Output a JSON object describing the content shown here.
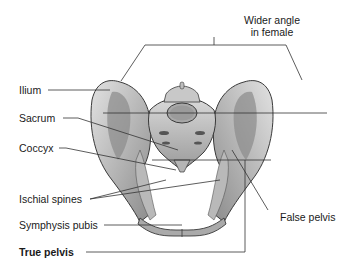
{
  "diagram": {
    "labels": {
      "wider_angle_line1": "Wider angle",
      "wider_angle_line2": "in female",
      "ilium": "Ilium",
      "sacrum": "Sacrum",
      "coccyx": "Coccyx",
      "ischial_spines": "Ischial spines",
      "symphysis_pubis": "Symphysis pubis",
      "true_pelvis": "True pelvis",
      "false_pelvis": "False pelvis"
    },
    "colors": {
      "bone_light": "#d4d4d4",
      "bone_mid": "#a8a8a8",
      "bone_dark": "#6e6e6e",
      "outline": "#3a3a3a",
      "leader_line": "#333333",
      "text": "#1a1a1a"
    }
  }
}
